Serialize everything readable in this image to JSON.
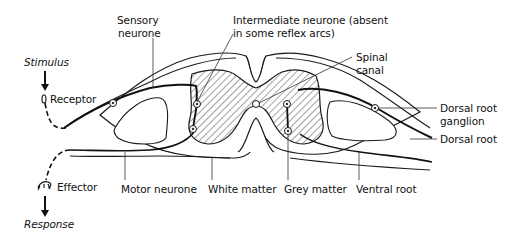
{
  "diagram": {
    "labels": {
      "stimulus": "Stimulus",
      "receptor": "Receptor",
      "sensory_neurone_1": "Sensory",
      "sensory_neurone_2": "neurone",
      "intermediate_1": "Intermediate neurone (absent",
      "intermediate_2": "in some reflex arcs)",
      "spinal_canal_1": "Spinal",
      "spinal_canal_2": "canal",
      "dorsal_root_ganglion_1": "Dorsal root",
      "dorsal_root_ganglion_2": "ganglion",
      "dorsal_root": "Dorsal root",
      "effector": "Effector",
      "response": "Response",
      "motor_neurone": "Motor neurone",
      "white_matter": "White matter",
      "grey_matter": "Grey matter",
      "ventral_root": "Ventral root"
    },
    "colors": {
      "line": "#1a1a1a",
      "background": "#ffffff",
      "hatch": "#333333"
    }
  }
}
